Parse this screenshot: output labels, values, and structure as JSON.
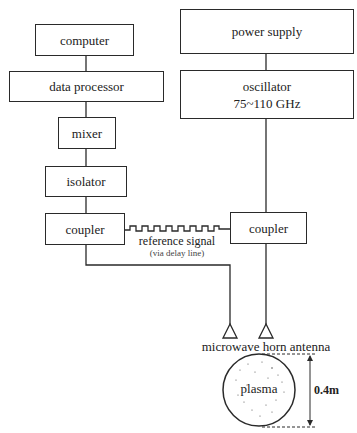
{
  "diagram": {
    "left_chain": {
      "computer": "computer",
      "data_processor": "data processor",
      "mixer": "mixer",
      "isolator": "isolator",
      "coupler": "coupler"
    },
    "right_chain": {
      "power_supply": "power supply",
      "oscillator": "oscillator",
      "oscillator_freq": "75~110 GHz",
      "coupler": "coupler"
    },
    "reference": {
      "label": "reference signal",
      "sublabel": "(via delay line)"
    },
    "antenna_label": "microwave horn antenna",
    "plasma_label": "plasma",
    "dimension_label": "0.4m"
  }
}
